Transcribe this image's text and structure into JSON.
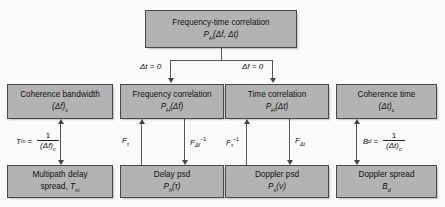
{
  "diagram": {
    "background_color": "#fbfbfb",
    "box_fill_color": "#b3b3b3",
    "box_border_color": "#4a4a4a",
    "line_color": "#555555"
  },
  "nodes": {
    "freq_time_correlation": {
      "line1": "Frequency-time correlation",
      "line2_P": "P",
      "line2_sub": "H",
      "line2_args": "(Δf, Δt)"
    },
    "coherence_bandwidth": {
      "line1": "Coherence bandwidth",
      "line2_main": "(Δf)",
      "line2_sub": "c"
    },
    "frequency_correlation": {
      "line1": "Frequency correlation",
      "line2_P": "P",
      "line2_sub": "H",
      "line2_args": "(Δf)"
    },
    "time_correlation": {
      "line1": "Time correlation",
      "line2_P": "P",
      "line2_sub": "H",
      "line2_args": "(Δt)"
    },
    "coherence_time": {
      "line1": "Coherence time",
      "line2_main": "(Δt)",
      "line2_sub": "c"
    },
    "multipath_delay_spread": {
      "line1": "Multipath delay",
      "line2_pre": "spread, ",
      "line2_T": "T",
      "line2_sub": "m"
    },
    "delay_psd": {
      "line1": "Delay psd",
      "line2_P": "P",
      "line2_sub": "h",
      "line2_args": "(τ)"
    },
    "doppler_psd": {
      "line1": "Doppler psd",
      "line2_P": "P",
      "line2_sub": "s",
      "line2_args": "(ν)"
    },
    "doppler_spread": {
      "line1": "Doppler spread",
      "line2_B": "B",
      "line2_sub": "d"
    }
  },
  "edges": {
    "delta_t_zero": "Δt = 0",
    "delta_f_zero": "Δf = 0",
    "f_tau": "F",
    "f_tau_sub": "τ",
    "f_deltaf_inv_main": "F",
    "f_deltaf_inv_sub": "Δf",
    "f_deltaf_inv_sup": "−1",
    "f_tau_inv_main": "F",
    "f_tau_inv_sub": "τ",
    "f_tau_inv_sup": "−1",
    "f_deltat_main": "F",
    "f_deltat_sub": "Δt"
  },
  "formulas": {
    "tm": {
      "lhs_var": "T",
      "lhs_sub": "m",
      "eq": "=",
      "numerator": "1",
      "denominator_main": "(Δf)",
      "denominator_sub": "c"
    },
    "bd": {
      "lhs_var": "B",
      "lhs_sub": "d",
      "eq": "=",
      "numerator": "1",
      "denominator_main": "(Δt)",
      "denominator_sub": "c"
    }
  }
}
